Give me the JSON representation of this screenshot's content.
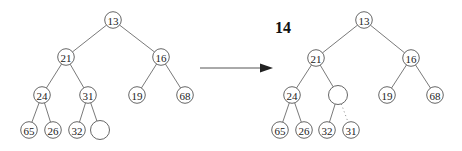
{
  "insert_value": "14",
  "before_tree": {
    "nodes": [
      {
        "id": "n13",
        "label": "13"
      },
      {
        "id": "n21",
        "label": "21"
      },
      {
        "id": "n16",
        "label": "16"
      },
      {
        "id": "n24",
        "label": "24"
      },
      {
        "id": "n31",
        "label": "31"
      },
      {
        "id": "n19",
        "label": "19"
      },
      {
        "id": "n68",
        "label": "68"
      },
      {
        "id": "n65",
        "label": "65"
      },
      {
        "id": "n26",
        "label": "26"
      },
      {
        "id": "n32",
        "label": "32"
      },
      {
        "id": "hole",
        "label": ""
      }
    ],
    "edges": [
      [
        "n13",
        "n21"
      ],
      [
        "n13",
        "n16"
      ],
      [
        "n21",
        "n24"
      ],
      [
        "n21",
        "n31"
      ],
      [
        "n16",
        "n19"
      ],
      [
        "n16",
        "n68"
      ],
      [
        "n24",
        "n65"
      ],
      [
        "n24",
        "n26"
      ],
      [
        "n31",
        "n32"
      ],
      [
        "n31",
        "hole"
      ]
    ]
  },
  "after_tree": {
    "nodes": [
      {
        "id": "n13",
        "label": "13"
      },
      {
        "id": "n21",
        "label": "21"
      },
      {
        "id": "n16",
        "label": "16"
      },
      {
        "id": "n24",
        "label": "24"
      },
      {
        "id": "hole",
        "label": ""
      },
      {
        "id": "n19",
        "label": "19"
      },
      {
        "id": "n68",
        "label": "68"
      },
      {
        "id": "n65",
        "label": "65"
      },
      {
        "id": "n26",
        "label": "26"
      },
      {
        "id": "n32",
        "label": "32"
      },
      {
        "id": "n31",
        "label": "31"
      }
    ],
    "edges": [
      [
        "n13",
        "n21",
        "solid"
      ],
      [
        "n13",
        "n16",
        "solid"
      ],
      [
        "n21",
        "n24",
        "solid"
      ],
      [
        "n21",
        "hole",
        "solid"
      ],
      [
        "n16",
        "n19",
        "solid"
      ],
      [
        "n16",
        "n68",
        "solid"
      ],
      [
        "n24",
        "n65",
        "solid"
      ],
      [
        "n24",
        "n26",
        "solid"
      ],
      [
        "hole",
        "n32",
        "solid"
      ],
      [
        "hole",
        "n31",
        "dotted"
      ]
    ]
  }
}
